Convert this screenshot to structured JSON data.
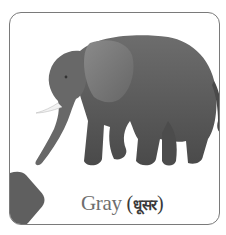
{
  "card": {
    "subject": "elephant",
    "color_name_en": "Gray",
    "color_name_hi": "धूसर",
    "paren_open": " (",
    "paren_close": ")",
    "swatch_color": "#5f5f5f",
    "border_color": "#7a7a7a"
  },
  "icons": {
    "illustration": "elephant-illustration",
    "swatch": "color-swatch-shape"
  }
}
